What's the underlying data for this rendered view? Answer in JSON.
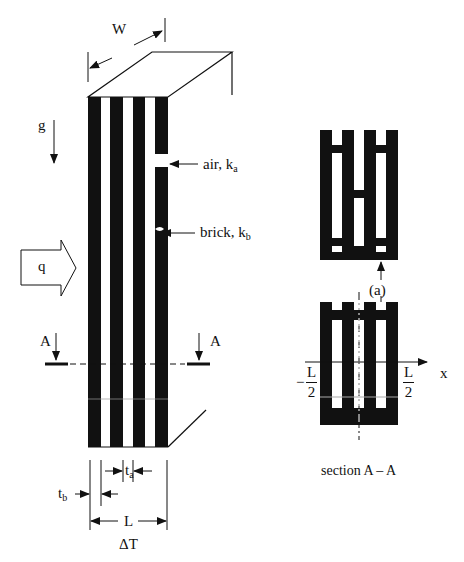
{
  "figure": {
    "type": "heat transfer through vertical brick/air cavity wall",
    "main_view": {
      "width_label": "W",
      "gravity_label": "g",
      "heat_flux_label": "q",
      "air_label": {
        "text": "air, k",
        "sub": "a"
      },
      "brick_label": {
        "text": "brick, k",
        "sub": "b"
      },
      "section_marker_left": "A",
      "section_marker_right": "A",
      "dim_ta": {
        "text": "t",
        "sub": "a"
      },
      "dim_tb": {
        "text": "t",
        "sub": "b"
      },
      "dim_L": "L",
      "delta_T": "ΔT"
    },
    "section_view": {
      "callout": "(a)",
      "axis_label": "x",
      "left_bound": {
        "sign": "−",
        "num": "L",
        "den": "2"
      },
      "right_bound": {
        "num": "L",
        "den": "2"
      },
      "caption": "section A – A"
    },
    "colors": {
      "ink": "#111111",
      "background": "#ffffff"
    }
  }
}
